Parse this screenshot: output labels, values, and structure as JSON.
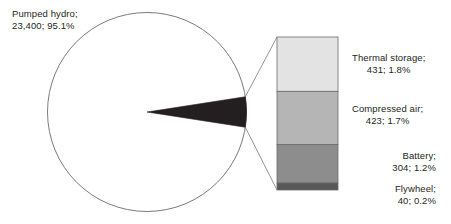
{
  "chart_data": {
    "type": "pie",
    "title": "",
    "subtitle": "",
    "variant": "bar-of-pie",
    "units": "MW",
    "total": 24598,
    "legend_position": "none",
    "grid": false,
    "categories": [
      "Pumped hydro",
      "Thermal storage",
      "Compressed air",
      "Battery",
      "Flywheel"
    ],
    "values": [
      23400,
      431,
      423,
      304,
      40
    ],
    "percents": [
      95.1,
      1.8,
      1.7,
      1.2,
      0.2
    ],
    "colors": [
      "#ffffff",
      "#e3e3e3",
      "#b5b5b5",
      "#8d8d8d",
      "#585858"
    ],
    "pie_slices": [
      {
        "name": "Pumped hydro",
        "value": 23400,
        "percent": 95.1,
        "color": "#ffffff"
      },
      {
        "name": "Other (exploded to bar)",
        "value": 1198,
        "percent": 4.9,
        "color": "#231f20"
      }
    ],
    "bar_segments": [
      {
        "name": "Thermal storage",
        "value": 431,
        "percent": 1.8,
        "color": "#e3e3e3"
      },
      {
        "name": "Compressed air",
        "value": 423,
        "percent": 1.7,
        "color": "#b5b5b5"
      },
      {
        "name": "Battery",
        "value": 304,
        "percent": 1.2,
        "color": "#8d8d8d"
      },
      {
        "name": "Flywheel",
        "value": 40,
        "percent": 0.2,
        "color": "#585858"
      }
    ]
  },
  "labels": {
    "pumped_hydro": {
      "name_line": "Pumped hydro;",
      "value_line": "23,400; 95.1%"
    },
    "thermal_storage": {
      "name_line": "Thermal storage;",
      "value_line": "431; 1.8%"
    },
    "compressed_air": {
      "name_line": "Compressed air;",
      "value_line": "423; 1.7%"
    },
    "battery": {
      "name_line": "Battery;",
      "value_line": "304; 1.2%"
    },
    "flywheel": {
      "name_line": "Flywheel;",
      "value_line": "40; 0.2%"
    }
  },
  "colors": {
    "outline": "#6b6b6b",
    "leader": "#8a8a8a",
    "text": "#231f20",
    "pie_main": "#ffffff",
    "pie_other": "#231f20",
    "seg_thermal": "#e3e3e3",
    "seg_compressed": "#b5b5b5",
    "seg_battery": "#8d8d8d",
    "seg_flywheel": "#585858",
    "background": "#ffffff"
  }
}
